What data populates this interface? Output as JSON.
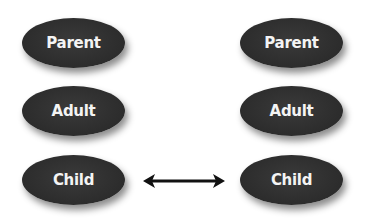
{
  "diagram": {
    "left_column": {
      "nodes": [
        {
          "label": "Parent"
        },
        {
          "label": "Adult"
        },
        {
          "label": "Child"
        }
      ]
    },
    "right_column": {
      "nodes": [
        {
          "label": "Parent"
        },
        {
          "label": "Adult"
        },
        {
          "label": "Child"
        }
      ]
    },
    "connections": [
      {
        "from": "left.Child",
        "to": "right.Child",
        "type": "bidirectional-arrow"
      }
    ],
    "colors": {
      "node_fill": "#2f2f2f",
      "node_text": "#f4f4f4",
      "arrow": "#111111",
      "background": "#ffffff"
    }
  }
}
